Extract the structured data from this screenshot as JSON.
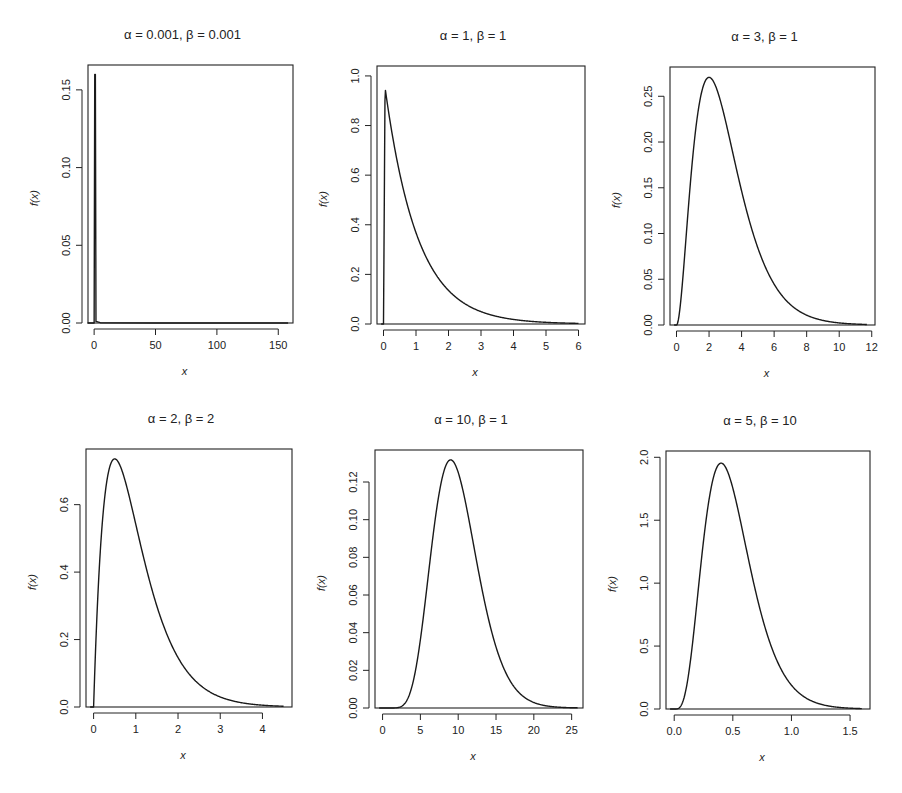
{
  "figure": {
    "ylabel": "f(x)",
    "xlabel": "x"
  },
  "chart_data": [
    {
      "type": "line",
      "title": "α = 0.001, β = 0.001",
      "alpha": 0.001,
      "beta": 0.001,
      "xlabel": "x",
      "ylabel": "f(x)",
      "xlim": [
        -5,
        162
      ],
      "ylim": [
        0,
        0.166
      ],
      "xticks": [
        0,
        50,
        100,
        150
      ],
      "xtick_labels": [
        "0",
        "50",
        "100",
        "150"
      ],
      "yticks": [
        0.0,
        0.05,
        0.1,
        0.15
      ],
      "ytick_labels": [
        "0.00",
        "0.05",
        "0.10",
        "0.15"
      ],
      "x_range": [
        0,
        158
      ],
      "peak": {
        "x": 1,
        "y": 0.16
      },
      "points": [
        [
          -5,
          0
        ],
        [
          0,
          0
        ],
        [
          0.5,
          0.16
        ],
        [
          1,
          0.16
        ],
        [
          1.5,
          0.001
        ],
        [
          5,
          0.0002
        ],
        [
          50,
          2e-05
        ],
        [
          100,
          1e-05
        ],
        [
          158,
          6e-06
        ]
      ]
    },
    {
      "type": "line",
      "title": "α = 1, β = 1",
      "alpha": 1,
      "beta": 1,
      "xlabel": "x",
      "ylabel": "f(x)",
      "xlim": [
        -0.2,
        6.2
      ],
      "ylim": [
        0,
        1.04
      ],
      "xticks": [
        0,
        1,
        2,
        3,
        4,
        5,
        6
      ],
      "xtick_labels": [
        "0",
        "1",
        "2",
        "3",
        "4",
        "5",
        "6"
      ],
      "yticks": [
        0.0,
        0.2,
        0.4,
        0.6,
        0.8,
        1.0
      ],
      "ytick_labels": [
        "0.0",
        "0.2",
        "0.4",
        "0.6",
        "0.8",
        "1.0"
      ],
      "x_range": [
        0,
        6
      ],
      "peak": {
        "x": 0.05,
        "y": 1.0
      },
      "points": [
        [
          0,
          0
        ],
        [
          0.05,
          1.0
        ],
        [
          0.5,
          0.607
        ],
        [
          1,
          0.368
        ],
        [
          1.5,
          0.223
        ],
        [
          2,
          0.135
        ],
        [
          3,
          0.05
        ],
        [
          4,
          0.018
        ],
        [
          5,
          0.007
        ],
        [
          6,
          0.002
        ]
      ]
    },
    {
      "type": "line",
      "title": "α = 3, β = 1",
      "alpha": 3,
      "beta": 1,
      "xlabel": "x",
      "ylabel": "f(x)",
      "xlim": [
        -0.4,
        12.2
      ],
      "ylim": [
        0,
        0.282
      ],
      "xticks": [
        0,
        2,
        4,
        6,
        8,
        10,
        12
      ],
      "xtick_labels": [
        "0",
        "2",
        "4",
        "6",
        "8",
        "10",
        "12"
      ],
      "yticks": [
        0.0,
        0.05,
        0.1,
        0.15,
        0.2,
        0.25
      ],
      "ytick_labels": [
        "0.00",
        "0.05",
        "0.10",
        "0.15",
        "0.20",
        "0.25"
      ],
      "x_range": [
        0,
        11.7
      ],
      "peak": {
        "x": 2,
        "y": 0.271
      },
      "points": [
        [
          0,
          0
        ],
        [
          1,
          0.184
        ],
        [
          2,
          0.271
        ],
        [
          3,
          0.224
        ],
        [
          4,
          0.147
        ],
        [
          5,
          0.084
        ],
        [
          6,
          0.045
        ],
        [
          8,
          0.011
        ],
        [
          10,
          0.002
        ],
        [
          11.7,
          0.0006
        ]
      ]
    },
    {
      "type": "line",
      "title": "α = 2, β = 2",
      "alpha": 2,
      "beta": 2,
      "xlabel": "x",
      "ylabel": "f(x)",
      "xlim": [
        -0.18,
        4.7
      ],
      "ylim": [
        0,
        0.765
      ],
      "xticks": [
        0,
        1,
        2,
        3,
        4
      ],
      "xtick_labels": [
        "0",
        "1",
        "2",
        "3",
        "4"
      ],
      "yticks": [
        0.0,
        0.2,
        0.4,
        0.6
      ],
      "ytick_labels": [
        "0.0",
        "0.2",
        "0.4",
        "0.6"
      ],
      "x_range": [
        0,
        4.5
      ],
      "peak": {
        "x": 0.5,
        "y": 0.736
      },
      "points": [
        [
          0,
          0
        ],
        [
          0.25,
          0.607
        ],
        [
          0.5,
          0.736
        ],
        [
          1,
          0.541
        ],
        [
          1.5,
          0.299
        ],
        [
          2,
          0.147
        ],
        [
          2.5,
          0.067
        ],
        [
          3,
          0.03
        ],
        [
          4,
          0.005
        ],
        [
          4.5,
          0.002
        ]
      ]
    },
    {
      "type": "line",
      "title": "α = 10, β = 1",
      "alpha": 10,
      "beta": 1,
      "xlabel": "x",
      "ylabel": "f(x)",
      "xlim": [
        -1,
        26.5
      ],
      "ylim": [
        0,
        0.137
      ],
      "xticks": [
        0,
        5,
        10,
        15,
        20,
        25
      ],
      "xtick_labels": [
        "0",
        "5",
        "10",
        "15",
        "20",
        "25"
      ],
      "yticks": [
        0.0,
        0.02,
        0.04,
        0.06,
        0.08,
        0.1,
        0.12
      ],
      "ytick_labels": [
        "0.00",
        "0.02",
        "0.04",
        "0.06",
        "0.08",
        "0.10",
        "0.12"
      ],
      "x_range": [
        0,
        25.8
      ],
      "peak": {
        "x": 9,
        "y": 0.132
      },
      "points": [
        [
          0,
          0
        ],
        [
          3,
          0.0027
        ],
        [
          5,
          0.036
        ],
        [
          7,
          0.101
        ],
        [
          9,
          0.132
        ],
        [
          11,
          0.114
        ],
        [
          13,
          0.073
        ],
        [
          15,
          0.035
        ],
        [
          18,
          0.007
        ],
        [
          22,
          0.0005
        ],
        [
          25.8,
          3e-05
        ]
      ]
    },
    {
      "type": "line",
      "title": "α = 5, β = 10",
      "alpha": 5,
      "beta": 10,
      "xlabel": "x",
      "ylabel": "f(x)",
      "xlim": [
        -0.07,
        1.67
      ],
      "ylim": [
        0,
        2.05
      ],
      "xticks": [
        0.0,
        0.5,
        1.0,
        1.5
      ],
      "xtick_labels": [
        "0.0",
        "0.5",
        "1.0",
        "1.5"
      ],
      "yticks": [
        0.0,
        0.5,
        1.0,
        1.5,
        2.0
      ],
      "ytick_labels": [
        "0.0",
        "0.5",
        "1.0",
        "1.5",
        "2.0"
      ],
      "x_range": [
        0,
        1.6
      ],
      "peak": {
        "x": 0.4,
        "y": 1.954
      },
      "points": [
        [
          0,
          0
        ],
        [
          0.1,
          0.153
        ],
        [
          0.2,
          1.804
        ],
        [
          0.3,
          1.681
        ],
        [
          0.4,
          1.954
        ],
        [
          0.5,
          1.755
        ],
        [
          0.6,
          1.339
        ],
        [
          0.8,
          0.573
        ],
        [
          1.0,
          0.189
        ],
        [
          1.3,
          0.026
        ],
        [
          1.6,
          0.003
        ]
      ]
    }
  ]
}
